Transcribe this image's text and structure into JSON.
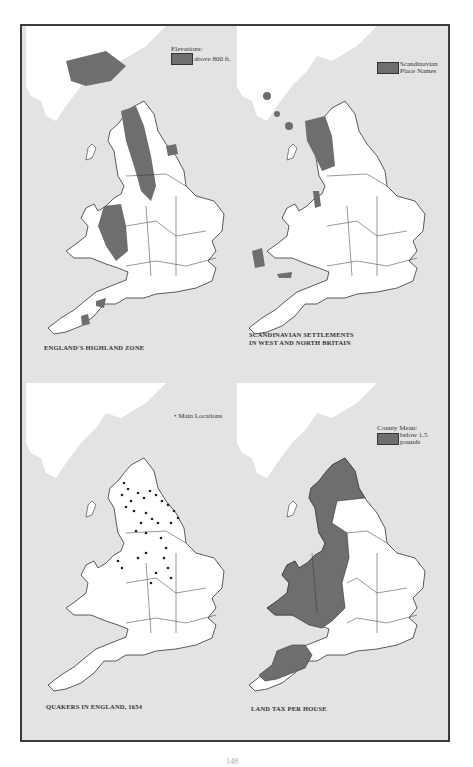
{
  "colors": {
    "sea": "#e3e3e3",
    "land_scotland": "#ffffff",
    "land_england": "#ffffff",
    "shaded": "#6e6e6e",
    "border": "#333333",
    "frame": "#3a3a3a"
  },
  "panels": [
    {
      "id": "highland",
      "legend_title": "Elevations:",
      "legend_label": "above 800 ft.",
      "caption_line1": "ENGLAND'S HIGHLAND ZONE",
      "caption_line2": ""
    },
    {
      "id": "scandinavian",
      "legend_title": "",
      "legend_label_line1": "Scandinavian",
      "legend_label_line2": "Place Names",
      "caption_line1": "SCANDINAVIAN SETTLEMENTS",
      "caption_line2": "IN WEST AND NORTH BRITAIN"
    },
    {
      "id": "quakers",
      "legend_marker": "•",
      "legend_label": "Main Locations",
      "caption_line1": "QUAKERS IN ENGLAND, 1654",
      "caption_line2": ""
    },
    {
      "id": "landtax",
      "legend_title": "County Mean:",
      "legend_label_line1": "below 1.5",
      "legend_label_line2": "pounds",
      "caption_line1": "LAND TAX PER HOUSE",
      "caption_line2": ""
    }
  ],
  "page_number": "148"
}
